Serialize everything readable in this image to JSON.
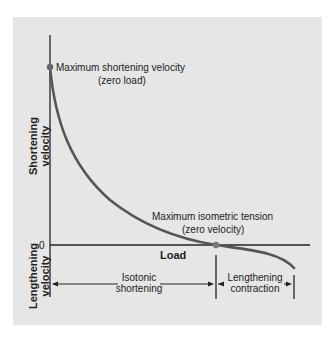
{
  "diagram": {
    "axes": {
      "y_upper_label_line1": "Shortening",
      "y_upper_label_line2": "velocity",
      "y_lower_label_line1": "Lengthening",
      "y_lower_label_line2": "velocity",
      "x_label": "Load",
      "zero_tick": "0"
    },
    "annotations": {
      "max_shortening_line1": "Maximum shortening velocity",
      "max_shortening_line2": "(zero load)",
      "max_isometric_line1": "Maximum isometric tension",
      "max_isometric_line2": "(zero velocity)"
    },
    "regions": {
      "isotonic_line1": "Isotonic",
      "isotonic_line2": "shortening",
      "lengthening_line1": "Lengthening",
      "lengthening_line2": "contraction"
    },
    "colors": {
      "background": "#e6e6e6",
      "curve": "#555555",
      "axis": "#222222",
      "point": "#666666"
    }
  }
}
